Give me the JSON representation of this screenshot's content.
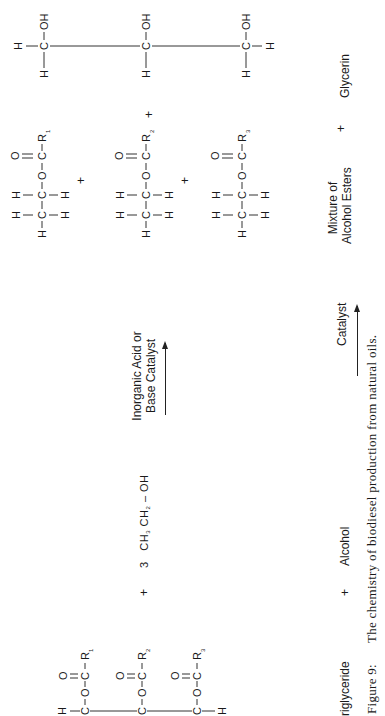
{
  "figure": {
    "number_label": "Figure 9:",
    "caption": "The chemistry of biodiesel production from natural oils."
  },
  "reaction": {
    "reactants": {
      "triglyceride": {
        "label": "riglyceride",
        "backbone": [
          "H",
          "C",
          "C",
          "C",
          "H"
        ],
        "chains": [
          {
            "group": "O-C-R",
            "carbonyl": "O",
            "r_index": "1"
          },
          {
            "group": "O-C-R",
            "carbonyl": "O",
            "r_index": "2"
          },
          {
            "group": "O-C-R",
            "carbonyl": "O",
            "r_index": "3"
          }
        ]
      },
      "plus_1": "+",
      "alcohol": {
        "label": "Alcohol",
        "coefficient": "3",
        "formula_parts": [
          "CH",
          "3",
          "CH",
          "2",
          "– OH"
        ]
      }
    },
    "arrow_top": {
      "line1": "Inorganic Acid or",
      "line2": "Base Catalyst"
    },
    "arrow_bottom": {
      "label": "Catalyst"
    },
    "products": {
      "esters": {
        "label_line1": "Mixture of",
        "label_line2": "Alcohol Esters",
        "items": [
          {
            "r_index": "1"
          },
          {
            "r_index": "2"
          },
          {
            "r_index": "3"
          }
        ],
        "plus": "+"
      },
      "plus_2": "+",
      "glycerin": {
        "label": "Glycerin",
        "groups": [
          "OH",
          "OH",
          "OH"
        ]
      }
    }
  },
  "atoms": {
    "H": "H",
    "C": "C",
    "O": "O",
    "R": "R",
    "OH": "OH"
  }
}
